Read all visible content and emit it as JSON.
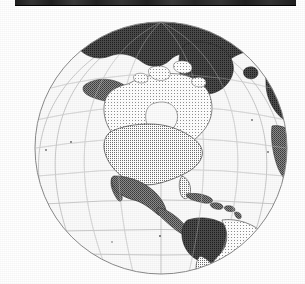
{
  "page": {
    "background_color": "#ffffff",
    "width": 305,
    "height": 284
  },
  "caption_band": {
    "label": "redacted-caption-band",
    "obscured_text": "",
    "color": "#1e1e1e"
  },
  "map": {
    "title": "",
    "projection": "orthographic",
    "center_lon": -90,
    "center_lat": 30,
    "graticule_step_deg": 15,
    "graticule_color": "#b9b9b9",
    "outline_color": "#8a8a8a",
    "ocean_color": "#fbfbfb",
    "circle": {
      "cx": 161,
      "cy": 148,
      "r": 126
    },
    "shade_legend": [
      {
        "name": "ocean",
        "color": "#fbfbfb"
      },
      {
        "name": "land-light",
        "color": "#e0e0e0"
      },
      {
        "name": "land-medium",
        "color": "#c0c0c0"
      },
      {
        "name": "land-dark",
        "color": "#9a9a9a"
      },
      {
        "name": "land-darkest",
        "color": "#6e6e6e"
      }
    ],
    "regions": [
      {
        "name": "arctic-eurasia",
        "shade": "#6e6e6e"
      },
      {
        "name": "greenland",
        "shade": "#6e6e6e"
      },
      {
        "name": "alaska",
        "shade": "#9a9a9a"
      },
      {
        "name": "canada",
        "shade": "#c6c6c6"
      },
      {
        "name": "united-states",
        "shade": "#9a9a9a"
      },
      {
        "name": "mexico",
        "shade": "#9a9a9a"
      },
      {
        "name": "central-america",
        "shade": "#9a9a9a"
      },
      {
        "name": "caribbean-islands",
        "shade": "#9a9a9a"
      },
      {
        "name": "south-america-north",
        "shade": "#6e6e6e"
      },
      {
        "name": "brazil",
        "shade": "#c6c6c6"
      },
      {
        "name": "west-africa-limb",
        "shade": "#9a9a9a"
      },
      {
        "name": "europe-limb",
        "shade": "#6e6e6e"
      }
    ]
  }
}
